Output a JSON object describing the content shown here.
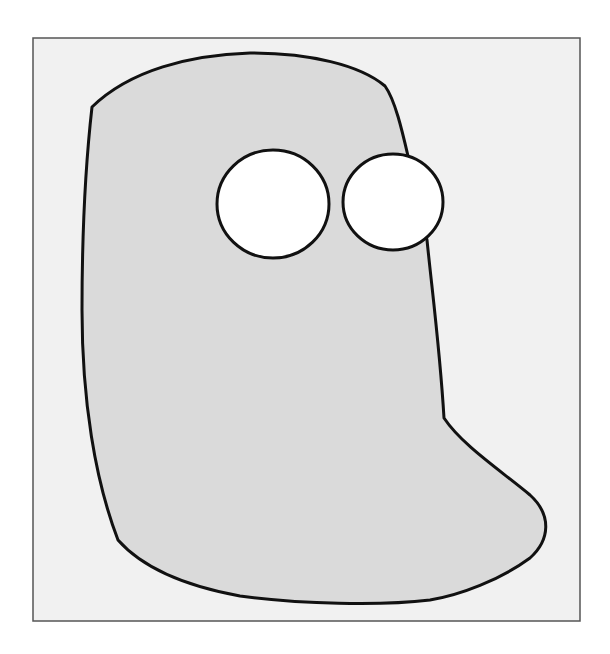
{
  "figure": {
    "colors": {
      "page_background": "#ffffff",
      "frame_background": "#f1f1f1",
      "frame_border": "#555555",
      "body_fill": "#dadada",
      "outline": "#111111",
      "eye_fill": "#ffffff"
    },
    "frame": {
      "x": 33,
      "y": 38,
      "width": 547,
      "height": 583
    },
    "body_path": "M92,107 C130,70 190,55 250,53 C310,53 360,65 385,86 C395,100 402,130 408,156 M426,240 C432,290 440,350 444,418 C462,445 500,470 530,495 C552,515 550,540 530,558 C500,580 460,595 430,600 C380,606 300,604 240,596 C180,585 140,565 118,540 C95,480 82,400 82,310 C82,230 86,160 92,107 Z",
    "body_fill_path": "M92,107 C130,70 190,55 250,53 C310,53 360,65 385,86 C395,100 402,130 408,156 L427,240 C432,290 440,350 444,418 C462,445 500,470 530,495 C552,515 550,540 530,558 C500,580 460,595 430,600 C380,606 300,604 240,596 C180,585 140,565 118,540 C95,480 82,400 82,310 C82,230 86,160 92,107 Z",
    "eyes": [
      {
        "name": "left-eye",
        "cx": 273,
        "cy": 204,
        "rx": 56,
        "ry": 54
      },
      {
        "name": "right-eye",
        "cx": 393,
        "cy": 202,
        "rx": 50,
        "ry": 48
      }
    ]
  }
}
